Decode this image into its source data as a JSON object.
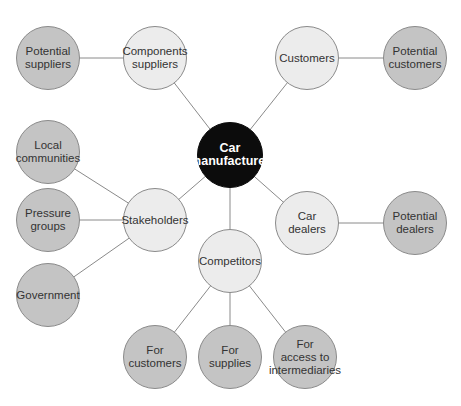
{
  "diagram": {
    "type": "stakeholder-map",
    "colors": {
      "center": "#0c0c0c",
      "primary": "#ececec",
      "secondary": "#c4c4c4",
      "line": "#8a8a8a"
    },
    "nodes": [
      {
        "id": "center",
        "label": "Car\nmanufacturer",
        "x": 230,
        "y": 155,
        "r": 33,
        "style": "center"
      },
      {
        "id": "components",
        "label": "Components\nsuppliers",
        "x": 155,
        "y": 58,
        "r": 32,
        "style": "light"
      },
      {
        "id": "potsup",
        "label": "Potential\nsuppliers",
        "x": 48,
        "y": 58,
        "r": 32,
        "style": "dark"
      },
      {
        "id": "customers",
        "label": "Customers",
        "x": 307,
        "y": 58,
        "r": 32,
        "style": "light"
      },
      {
        "id": "potcust",
        "label": "Potential\ncustomers",
        "x": 415,
        "y": 58,
        "r": 32,
        "style": "dark"
      },
      {
        "id": "stake",
        "label": "Stakeholders",
        "x": 155,
        "y": 220,
        "r": 32,
        "style": "light"
      },
      {
        "id": "local",
        "label": "Local\ncommunities",
        "x": 48,
        "y": 152,
        "r": 32,
        "style": "dark"
      },
      {
        "id": "pressure",
        "label": "Pressure\ngroups",
        "x": 48,
        "y": 220,
        "r": 32,
        "style": "dark"
      },
      {
        "id": "gov",
        "label": "Government",
        "x": 48,
        "y": 295,
        "r": 32,
        "style": "dark"
      },
      {
        "id": "dealers",
        "label": "Car\ndealers",
        "x": 307,
        "y": 223,
        "r": 32,
        "style": "light"
      },
      {
        "id": "potdeal",
        "label": "Potential\ndealers",
        "x": 415,
        "y": 223,
        "r": 32,
        "style": "dark"
      },
      {
        "id": "comp",
        "label": "Competitors",
        "x": 230,
        "y": 261,
        "r": 32,
        "style": "light"
      },
      {
        "id": "forcust",
        "label": "For\ncustomers",
        "x": 155,
        "y": 357,
        "r": 32,
        "style": "dark"
      },
      {
        "id": "forsup",
        "label": "For\nsupplies",
        "x": 230,
        "y": 357,
        "r": 32,
        "style": "dark"
      },
      {
        "id": "foracc",
        "label": "For\naccess to\nintermediaries",
        "x": 305,
        "y": 357,
        "r": 32,
        "style": "dark"
      }
    ],
    "edges": [
      [
        "center",
        "components"
      ],
      [
        "center",
        "customers"
      ],
      [
        "center",
        "stake"
      ],
      [
        "center",
        "dealers"
      ],
      [
        "center",
        "comp"
      ],
      [
        "components",
        "potsup"
      ],
      [
        "customers",
        "potcust"
      ],
      [
        "stake",
        "local"
      ],
      [
        "stake",
        "pressure"
      ],
      [
        "stake",
        "gov"
      ],
      [
        "dealers",
        "potdeal"
      ],
      [
        "comp",
        "forcust"
      ],
      [
        "comp",
        "forsup"
      ],
      [
        "comp",
        "foracc"
      ]
    ]
  }
}
